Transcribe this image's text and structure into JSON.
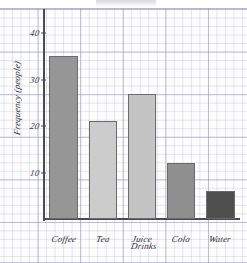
{
  "chart_data": {
    "type": "bar",
    "title": "",
    "xlabel": "Drinks",
    "ylabel": "Frequency (people)",
    "categories": [
      "Coffee",
      "Tea",
      "Juice",
      "Cola",
      "Water"
    ],
    "values": [
      35,
      21,
      27,
      12,
      6
    ],
    "ylim": [
      0,
      45
    ],
    "yticks": [
      10,
      20,
      30,
      40
    ],
    "ytick_labels": [
      "10",
      "20",
      "30",
      "40"
    ],
    "grid": true,
    "legend": "none",
    "bar_colors": [
      "#969696",
      "#cccccc",
      "#c4c4c4",
      "#8f8f8f",
      "#4f4f4f"
    ],
    "bar_border_color": "#6b6b6b",
    "axis_color": "#4a4a52",
    "grid_color": "#9696be",
    "background": "#fdfdfd"
  }
}
